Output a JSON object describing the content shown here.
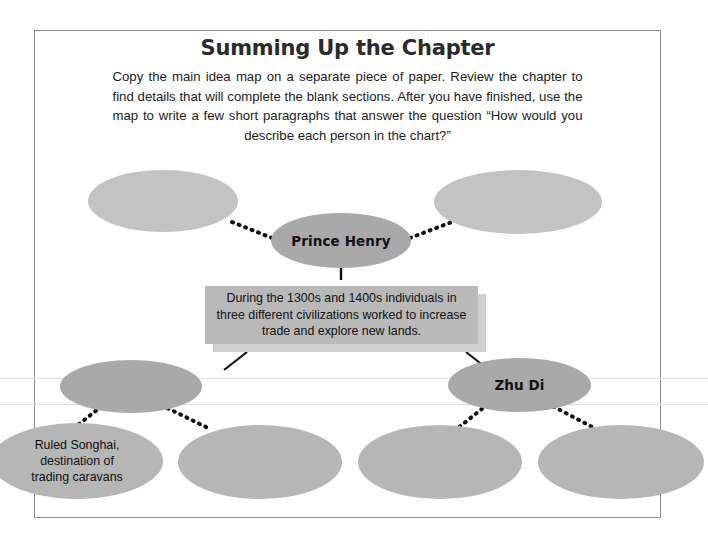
{
  "page": {
    "title": "Summing Up the Chapter",
    "intro": "Copy the main idea map on a separate piece of paper. Review the chapter to find details that will complete the blank sections. After you have finished, use the map to write a few short paragraphs that answer the question “How would you describe each person in the chart?”"
  },
  "diagram": {
    "center_statement": "During the 1300s and 1400s individuals in three different civilizations worked to increase trade and explore new lands.",
    "nodes": [
      {
        "id": "top-left",
        "label": "",
        "filled": false
      },
      {
        "id": "prince-henry",
        "label": "Prince Henry",
        "filled": true
      },
      {
        "id": "top-right",
        "label": "",
        "filled": false
      },
      {
        "id": "mid-left",
        "label": "",
        "filled": true
      },
      {
        "id": "zhu-di",
        "label": "Zhu Di",
        "filled": true
      },
      {
        "id": "detail-songhai",
        "label": "Ruled Songhai,\ndestination of\ntrading caravans",
        "filled": false
      },
      {
        "id": "detail-2",
        "label": "",
        "filled": false
      },
      {
        "id": "detail-3",
        "label": "",
        "filled": false
      },
      {
        "id": "detail-4",
        "label": "",
        "filled": false
      }
    ]
  },
  "colors": {
    "node_empty": "#c3c3c3",
    "node_filled": "#a9a9a9",
    "box_fill": "#b9b9b9",
    "box_shadow": "#cfcfcf",
    "border": "#8c8c8c",
    "text": "#111111"
  }
}
